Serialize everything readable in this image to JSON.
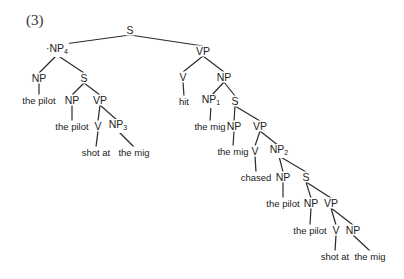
{
  "example_number": "(3)",
  "colors": {
    "line": "#2a2a2a",
    "text": "#222222",
    "background": "#ffffff"
  },
  "nodes": [
    {
      "id": "n0",
      "label": "S",
      "sub": "",
      "type": "node",
      "x": 130,
      "y": 30
    },
    {
      "id": "n1",
      "label": "NP",
      "sub": "4",
      "type": "node",
      "x": 57,
      "y": 50,
      "prefix": "·"
    },
    {
      "id": "n2",
      "label": "NP",
      "sub": "",
      "type": "node",
      "x": 39,
      "y": 78
    },
    {
      "id": "n3",
      "label": "the pilot",
      "sub": "",
      "type": "word",
      "x": 39,
      "y": 100
    },
    {
      "id": "n4",
      "label": "S",
      "sub": "",
      "type": "node",
      "x": 84,
      "y": 78
    },
    {
      "id": "n5",
      "label": "NP",
      "sub": "",
      "type": "node",
      "x": 72,
      "y": 100
    },
    {
      "id": "n6",
      "label": "the pilot",
      "sub": "",
      "type": "word",
      "x": 72,
      "y": 126
    },
    {
      "id": "n7",
      "label": "VP",
      "sub": "",
      "type": "node",
      "x": 100,
      "y": 100
    },
    {
      "id": "n8",
      "label": "V",
      "sub": "",
      "type": "node",
      "x": 98,
      "y": 126
    },
    {
      "id": "n9",
      "label": "shot at",
      "sub": "",
      "type": "word",
      "x": 96,
      "y": 152
    },
    {
      "id": "n10",
      "label": "NP",
      "sub": "3",
      "type": "node",
      "x": 118,
      "y": 126
    },
    {
      "id": "n11",
      "label": "the mig",
      "sub": "",
      "type": "word",
      "x": 134,
      "y": 152
    },
    {
      "id": "n12",
      "label": "VP",
      "sub": "",
      "type": "node",
      "x": 203,
      "y": 51
    },
    {
      "id": "n13",
      "label": "V",
      "sub": "",
      "type": "node",
      "x": 183,
      "y": 77
    },
    {
      "id": "n14",
      "label": "hit",
      "sub": "",
      "type": "word",
      "x": 184,
      "y": 101
    },
    {
      "id": "n15",
      "label": "NP",
      "sub": "",
      "type": "node",
      "x": 224,
      "y": 77
    },
    {
      "id": "n16",
      "label": "NP",
      "sub": "1",
      "type": "node",
      "x": 211,
      "y": 101
    },
    {
      "id": "n17",
      "label": "the mig",
      "sub": "",
      "type": "word",
      "x": 210,
      "y": 126
    },
    {
      "id": "n18",
      "label": "S",
      "sub": "",
      "type": "node",
      "x": 235,
      "y": 101
    },
    {
      "id": "n19",
      "label": "NP",
      "sub": "",
      "type": "node",
      "x": 234,
      "y": 126
    },
    {
      "id": "n20",
      "label": "the mig",
      "sub": "",
      "type": "word",
      "x": 233,
      "y": 151
    },
    {
      "id": "n21",
      "label": "VP",
      "sub": "",
      "type": "node",
      "x": 260,
      "y": 126
    },
    {
      "id": "n22",
      "label": "V",
      "sub": "",
      "type": "node",
      "x": 255,
      "y": 151
    },
    {
      "id": "n23",
      "label": "chased",
      "sub": "",
      "type": "word",
      "x": 256,
      "y": 177
    },
    {
      "id": "n24",
      "label": "NP",
      "sub": "2",
      "type": "node",
      "x": 279,
      "y": 151
    },
    {
      "id": "n25",
      "label": "NP",
      "sub": "",
      "type": "node",
      "x": 283,
      "y": 177
    },
    {
      "id": "n26",
      "label": "the pilot",
      "sub": "",
      "type": "word",
      "x": 283,
      "y": 203
    },
    {
      "id": "n27",
      "label": "S",
      "sub": "",
      "type": "node",
      "x": 306,
      "y": 177
    },
    {
      "id": "n28",
      "label": "NP",
      "sub": "",
      "type": "node",
      "x": 311,
      "y": 203
    },
    {
      "id": "n29",
      "label": "the pilot",
      "sub": "",
      "type": "word",
      "x": 310,
      "y": 230
    },
    {
      "id": "n30",
      "label": "VP",
      "sub": "",
      "type": "node",
      "x": 331,
      "y": 203
    },
    {
      "id": "n31",
      "label": "V",
      "sub": "",
      "type": "node",
      "x": 336,
      "y": 230
    },
    {
      "id": "n32",
      "label": "shot at",
      "sub": "",
      "type": "word",
      "x": 335,
      "y": 256
    },
    {
      "id": "n33",
      "label": "NP",
      "sub": "",
      "type": "node",
      "x": 353,
      "y": 230
    },
    {
      "id": "n34",
      "label": "the mig",
      "sub": "",
      "type": "word",
      "x": 370,
      "y": 256
    }
  ],
  "edges": [
    [
      "n0",
      "n1"
    ],
    [
      "n0",
      "n12"
    ],
    [
      "n1",
      "n2"
    ],
    [
      "n1",
      "n4"
    ],
    [
      "n2",
      "n3"
    ],
    [
      "n4",
      "n5"
    ],
    [
      "n4",
      "n7"
    ],
    [
      "n5",
      "n6"
    ],
    [
      "n7",
      "n8"
    ],
    [
      "n7",
      "n10"
    ],
    [
      "n8",
      "n9"
    ],
    [
      "n10",
      "n11"
    ],
    [
      "n12",
      "n13"
    ],
    [
      "n12",
      "n15"
    ],
    [
      "n13",
      "n14"
    ],
    [
      "n15",
      "n16"
    ],
    [
      "n15",
      "n18"
    ],
    [
      "n16",
      "n17"
    ],
    [
      "n18",
      "n19"
    ],
    [
      "n18",
      "n21"
    ],
    [
      "n19",
      "n20"
    ],
    [
      "n21",
      "n22"
    ],
    [
      "n21",
      "n24"
    ],
    [
      "n22",
      "n23"
    ],
    [
      "n24",
      "n25"
    ],
    [
      "n24",
      "n27"
    ],
    [
      "n25",
      "n26"
    ],
    [
      "n27",
      "n28"
    ],
    [
      "n27",
      "n30"
    ],
    [
      "n28",
      "n29"
    ],
    [
      "n30",
      "n31"
    ],
    [
      "n30",
      "n33"
    ],
    [
      "n31",
      "n32"
    ],
    [
      "n33",
      "n34"
    ]
  ]
}
